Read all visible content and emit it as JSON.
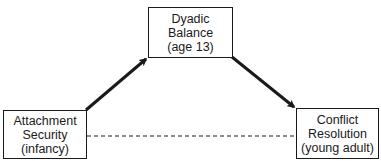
{
  "diagram": {
    "type": "mediation-path-diagram",
    "nodes": [
      {
        "id": "attachment",
        "lines": [
          "Attachment",
          "Security",
          "(infancy)"
        ]
      },
      {
        "id": "dyadic",
        "lines": [
          "Dyadic",
          "Balance",
          "(age 13)"
        ]
      },
      {
        "id": "conflict",
        "lines": [
          "Conflict",
          "Resolution",
          "(young adult)"
        ]
      }
    ],
    "edges": [
      {
        "from": "attachment",
        "to": "dyadic",
        "style": "solid-arrow"
      },
      {
        "from": "dyadic",
        "to": "conflict",
        "style": "solid-arrow"
      },
      {
        "from": "attachment",
        "to": "conflict",
        "style": "dashed-line"
      }
    ],
    "colors": {
      "stroke": "#1a1a1a",
      "background": "#ffffff"
    }
  }
}
